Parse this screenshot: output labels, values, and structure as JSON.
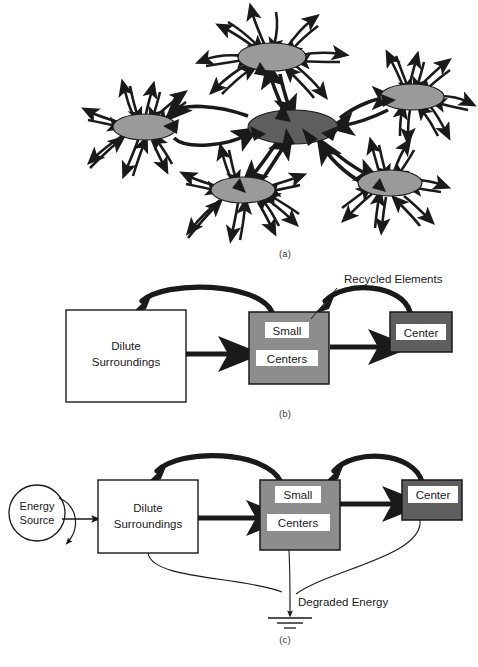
{
  "figure": {
    "panels": [
      {
        "id": "a",
        "label": "(a)",
        "description": "Network of ecosystem centers with radiating bidirectional energy exchange arrows",
        "node_count": 6,
        "nodes": [
          {
            "name": "top-center-node",
            "fill": "#9a9a9a",
            "cx": 272,
            "cy": 57,
            "rx": 34,
            "ry": 14,
            "rays": 9
          },
          {
            "name": "right-node",
            "fill": "#9a9a9a",
            "cx": 412,
            "cy": 97,
            "rx": 32,
            "ry": 13,
            "rays": 8
          },
          {
            "name": "left-node",
            "fill": "#9a9a9a",
            "cx": 145,
            "cy": 127,
            "rx": 32,
            "ry": 13,
            "rays": 9
          },
          {
            "name": "hub-node",
            "fill": "#5e5e5e",
            "cx": 293,
            "cy": 127,
            "rx": 45,
            "ry": 17,
            "rays": 0
          },
          {
            "name": "bottom-left-node",
            "fill": "#9a9a9a",
            "cx": 243,
            "cy": 190,
            "rx": 32,
            "ry": 13,
            "rays": 9
          },
          {
            "name": "bottom-right-node",
            "fill": "#9a9a9a",
            "cx": 390,
            "cy": 183,
            "rx": 32,
            "ry": 13,
            "rays": 8
          }
        ]
      },
      {
        "id": "b",
        "label": "(b)",
        "annotation": "Recycled Elements",
        "boxes": [
          {
            "name": "dilute-surroundings-box",
            "lines": [
              "Dilute",
              "Surroundings"
            ],
            "fill": "#ffffff",
            "text_color": "#1a1a1a",
            "boxed_labels": false
          },
          {
            "name": "small-centers-box",
            "lines": [
              "Small",
              "Centers"
            ],
            "fill": "#8d8d8d",
            "text_color": "#1a1a1a",
            "boxed_labels": true
          },
          {
            "name": "center-box",
            "lines": [
              "Center"
            ],
            "fill": "#5e5e5e",
            "text_color": "#1a1a1a",
            "boxed_labels": true
          }
        ],
        "flow_arrows": [
          {
            "from": "dilute-surroundings-box",
            "to": "small-centers-box",
            "kind": "thick-straight"
          },
          {
            "from": "small-centers-box",
            "to": "center-box",
            "kind": "thick-straight"
          },
          {
            "from": "small-centers-box",
            "to": "dilute-surroundings-box",
            "kind": "thick-curved-recycle"
          },
          {
            "from": "center-box",
            "to": "small-centers-box",
            "kind": "thick-curved-recycle"
          }
        ]
      },
      {
        "id": "c",
        "label": "(c)",
        "annotation": "Degraded Energy",
        "source": {
          "name": "energy-source-circle",
          "lines": [
            "Energy",
            "Source"
          ],
          "shape": "circle",
          "fill": "#ffffff"
        },
        "boxes": [
          {
            "name": "dilute-surroundings-box",
            "lines": [
              "Dilute",
              "Surroundings"
            ],
            "fill": "#ffffff",
            "text_color": "#1a1a1a",
            "boxed_labels": false
          },
          {
            "name": "small-centers-box",
            "lines": [
              "Small",
              "Centers"
            ],
            "fill": "#8d8d8d",
            "text_color": "#1a1a1a",
            "boxed_labels": true
          },
          {
            "name": "center-box",
            "lines": [
              "Center"
            ],
            "fill": "#5e5e5e",
            "text_color": "#1a1a1a",
            "boxed_labels": true
          }
        ],
        "flow_arrows": [
          {
            "from": "energy-source-circle",
            "to": "dilute-surroundings-box",
            "kind": "thin-straight"
          },
          {
            "from": "energy-source-circle",
            "to": "loss",
            "kind": "thin-curved-loss"
          },
          {
            "from": "dilute-surroundings-box",
            "to": "small-centers-box",
            "kind": "thick-straight"
          },
          {
            "from": "small-centers-box",
            "to": "center-box",
            "kind": "thick-straight"
          },
          {
            "from": "small-centers-box",
            "to": "dilute-surroundings-box",
            "kind": "thick-curved-recycle"
          },
          {
            "from": "center-box",
            "to": "small-centers-box",
            "kind": "thick-curved-recycle"
          },
          {
            "from": "dilute-surroundings-box",
            "to": "ground-symbol",
            "kind": "thin-curved-degraded"
          },
          {
            "from": "small-centers-box",
            "to": "ground-symbol",
            "kind": "thin-curved-degraded"
          },
          {
            "from": "center-box",
            "to": "ground-symbol",
            "kind": "thin-curved-degraded"
          }
        ],
        "ground": {
          "name": "ground-symbol",
          "bars": 3
        }
      }
    ]
  },
  "caption": {
    "text": ""
  },
  "colors": {
    "node_light": "#9a9a9a",
    "node_dark": "#5e5e5e",
    "box_mid_gray": "#8d8d8d",
    "box_dark_gray": "#5e5e5e",
    "stroke": "#1a1a1a",
    "background": "#ffffff"
  }
}
